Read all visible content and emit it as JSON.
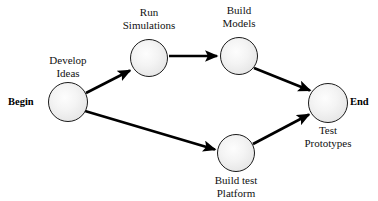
{
  "diagram": {
    "type": "directed-network-flow",
    "background_color": "#ffffff",
    "node_fill_color": "#ececec",
    "node_stroke_color": "#1b1b1b",
    "edge_color": "#000000",
    "start_marker": "Begin",
    "end_marker": "End",
    "nodes": [
      {
        "id": "develop-ideas",
        "label_lines": [
          "Develop",
          "Ideas"
        ],
        "label_position": "above",
        "cx": 68,
        "cy": 102,
        "r": 20
      },
      {
        "id": "run-simulations",
        "label_lines": [
          "Run",
          "Simulations"
        ],
        "label_position": "above",
        "cx": 149,
        "cy": 58,
        "r": 19
      },
      {
        "id": "build-models",
        "label_lines": [
          "Build",
          "Models"
        ],
        "label_position": "above",
        "cx": 239,
        "cy": 56,
        "r": 19
      },
      {
        "id": "build-test-platform",
        "label_lines": [
          "Build test",
          "Platform"
        ],
        "label_position": "below",
        "cx": 236,
        "cy": 153,
        "r": 19
      },
      {
        "id": "test-prototypes",
        "label_lines": [
          "Test",
          "Prototypes"
        ],
        "label_position": "below",
        "cx": 328,
        "cy": 103,
        "r": 20
      }
    ],
    "edges": [
      {
        "id": "develop-ideas-to-run-simulations",
        "from": "develop-ideas",
        "to": "run-simulations",
        "x1": 86,
        "y1": 93,
        "x2": 131,
        "y2": 70,
        "arrowhead": true
      },
      {
        "id": "run-simulations-to-build-models",
        "from": "run-simulations",
        "to": "build-models",
        "x1": 169,
        "y1": 56,
        "x2": 219,
        "y2": 56,
        "arrowhead": true
      },
      {
        "id": "build-models-to-test-prototypes",
        "from": "build-models",
        "to": "test-prototypes",
        "x1": 254,
        "y1": 68,
        "x2": 312,
        "y2": 91,
        "arrowhead": true
      },
      {
        "id": "develop-ideas-to-build-test-platform",
        "from": "develop-ideas",
        "to": "build-test-platform",
        "x1": 85,
        "y1": 111,
        "x2": 216,
        "y2": 150,
        "arrowhead": true
      },
      {
        "id": "build-test-platform-to-test-prototypes",
        "from": "build-test-platform",
        "to": "test-prototypes",
        "x1": 253,
        "y1": 144,
        "x2": 311,
        "y2": 114,
        "arrowhead": true
      }
    ],
    "endpoints": [
      {
        "id": "begin",
        "label": "Begin",
        "x": 8,
        "y": 95
      },
      {
        "id": "end",
        "label": "End",
        "x": 350,
        "y": 95
      }
    ]
  }
}
